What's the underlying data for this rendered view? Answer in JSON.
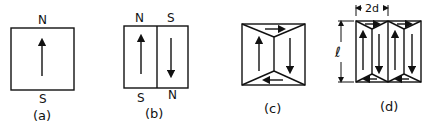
{
  "figure": {
    "panels": [
      {
        "id": "a",
        "caption": "(a)",
        "labels": {
          "top": "N",
          "bottom": "S"
        },
        "description": "single domain, magnetization up"
      },
      {
        "id": "b",
        "caption": "(b)",
        "labels": {
          "top_left": "N",
          "top_right": "S",
          "bottom_left": "S",
          "bottom_right": "N"
        },
        "description": "two antiparallel domains"
      },
      {
        "id": "c",
        "caption": "(c)",
        "description": "closure domains: flux loop with triangular end domains"
      },
      {
        "id": "d",
        "caption": "(d)",
        "dimension_width": "2d",
        "dimension_height": "ℓ",
        "description": "multiple domains with closure domains"
      }
    ],
    "colors": {
      "ink": "#111111",
      "background": "#ffffff"
    }
  }
}
